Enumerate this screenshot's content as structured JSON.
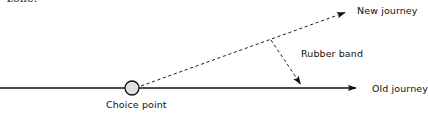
{
  "figure": {
    "kind": "line-diagram",
    "caption_fragment": "zone.",
    "background_color": "#ffffff",
    "stroke_color": "#1a1a1a",
    "node_fill_color": "#e0e0e0"
  },
  "labels": {
    "new_journey": "New journey",
    "rubber_band": "Rubber band",
    "old_journey": "Old journey",
    "choice_point": "Choice point"
  },
  "elements": {
    "old_journey_line": {
      "name": "old-journey-axis",
      "style": "solid",
      "arrowhead": "right-end",
      "x1": 0,
      "y1": 88,
      "x2": 356,
      "y2": 88
    },
    "new_journey_line": {
      "name": "new-journey-path",
      "style": "dashed",
      "arrowhead": "upper-right-end",
      "x1": 141,
      "y1": 86,
      "x2": 345,
      "y2": 13
    },
    "rubber_band_arrow": {
      "name": "rubber-band-connector",
      "style": "dashed",
      "arrowhead": "lower-right-end",
      "x1": 272,
      "y1": 41,
      "x2": 300,
      "y2": 85
    },
    "choice_point_node": {
      "name": "choice-point-node",
      "shape": "circle",
      "cx": 132,
      "cy": 88,
      "r": 7
    }
  }
}
